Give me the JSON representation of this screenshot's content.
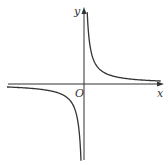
{
  "chart_data": {
    "type": "line",
    "title": "",
    "xlabel": "x",
    "ylabel": "y",
    "origin_label": "O",
    "grid": false,
    "legend": null,
    "axes": {
      "x_axis_arrow": true,
      "y_axis_arrow": true,
      "ticks": []
    },
    "series": [
      {
        "name": "branch-quadrant-I",
        "points": [
          [
            0.1,
            10
          ],
          [
            0.2,
            5
          ],
          [
            0.5,
            2
          ],
          [
            1,
            1
          ],
          [
            2,
            0.5
          ],
          [
            4,
            0.25
          ],
          [
            7,
            0.14
          ]
        ]
      },
      {
        "name": "branch-quadrant-III",
        "points": [
          [
            -7,
            -0.14
          ],
          [
            -4,
            -0.25
          ],
          [
            -2,
            -0.5
          ],
          [
            -1,
            -1
          ],
          [
            -0.5,
            -2
          ],
          [
            -0.2,
            -5
          ],
          [
            -0.1,
            -10
          ]
        ]
      }
    ]
  },
  "labels": {
    "x_axis": "x",
    "y_axis": "y",
    "origin": "O"
  },
  "colors": {
    "curve": "#333333",
    "axis": "#333333"
  }
}
